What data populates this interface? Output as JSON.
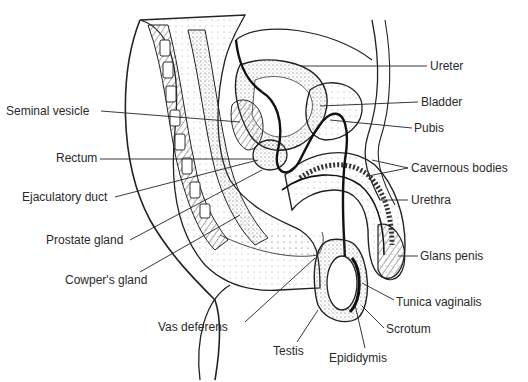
{
  "diagram": {
    "labels_left": [
      {
        "id": "seminal-vesicle",
        "text": "Seminal vesicle",
        "x": 6,
        "y": 104
      },
      {
        "id": "rectum",
        "text": "Rectum",
        "x": 56,
        "y": 151
      },
      {
        "id": "ejaculatory-duct",
        "text": "Ejaculatory duct",
        "x": 22,
        "y": 190
      },
      {
        "id": "prostate-gland",
        "text": "Prostate gland",
        "x": 46,
        "y": 234
      },
      {
        "id": "cowpers-gland",
        "text": "Cowper's gland",
        "x": 65,
        "y": 274
      }
    ],
    "labels_right": [
      {
        "id": "ureter",
        "text": "Ureter",
        "x": 430,
        "y": 59
      },
      {
        "id": "bladder",
        "text": "Bladder",
        "x": 421,
        "y": 95
      },
      {
        "id": "pubis",
        "text": "Pubis",
        "x": 414,
        "y": 122
      },
      {
        "id": "cavernous-bodies",
        "text": "Cavernous bodies",
        "x": 411,
        "y": 162
      },
      {
        "id": "urethra",
        "text": "Urethra",
        "x": 411,
        "y": 194
      },
      {
        "id": "glans-penis",
        "text": "Glans penis",
        "x": 420,
        "y": 248
      }
    ],
    "labels_bottom": [
      {
        "id": "tunica-vaginalis",
        "text": "Tunica vaginalis",
        "x": 396,
        "y": 295
      },
      {
        "id": "vas-deferens",
        "text": "Vas deferens",
        "x": 158,
        "y": 320
      },
      {
        "id": "scrotum",
        "text": "Scrotum",
        "x": 386,
        "y": 323
      },
      {
        "id": "testis",
        "text": "Testis",
        "x": 273,
        "y": 344
      },
      {
        "id": "epididymis",
        "text": "Epididymis",
        "x": 329,
        "y": 350
      }
    ]
  }
}
